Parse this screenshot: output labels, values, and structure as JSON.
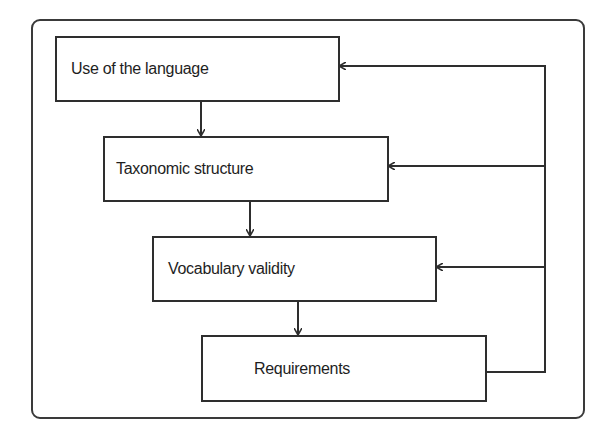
{
  "diagram": {
    "type": "flowchart",
    "colors": {
      "stroke": "#2e2e2e",
      "background": "#ffffff",
      "text": "#1e1e1e"
    },
    "boxes": [
      {
        "id": "use",
        "label": "Use of the language"
      },
      {
        "id": "taxonomy",
        "label": "Taxonomic structure"
      },
      {
        "id": "vocabulary",
        "label": "Vocabulary validity"
      },
      {
        "id": "requirements",
        "label": "Requirements"
      }
    ],
    "edges": [
      {
        "from": "use",
        "to": "taxonomy",
        "kind": "down-arrow"
      },
      {
        "from": "taxonomy",
        "to": "vocabulary",
        "kind": "down-arrow"
      },
      {
        "from": "vocabulary",
        "to": "requirements",
        "kind": "down-arrow"
      },
      {
        "from": "requirements",
        "to": "use",
        "kind": "feedback"
      },
      {
        "from": "requirements",
        "to": "taxonomy",
        "kind": "feedback"
      },
      {
        "from": "requirements",
        "to": "vocabulary",
        "kind": "feedback"
      }
    ]
  }
}
